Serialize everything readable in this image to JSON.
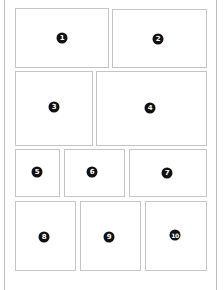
{
  "diagram": {
    "title": "",
    "colors": {
      "panel_border": "#c4c4c4",
      "frame_border": "#bdbdbd",
      "badge_fill": "#111111",
      "badge_text": "#ffffff",
      "background": "#ffffff"
    },
    "panels": [
      {
        "number": "1",
        "x": 15,
        "y": 8,
        "w": 94,
        "h": 60,
        "badge_x": 62,
        "badge_y": 38
      },
      {
        "number": "2",
        "x": 112,
        "y": 9,
        "w": 95,
        "h": 59,
        "badge_x": 158,
        "badge_y": 39
      },
      {
        "number": "3",
        "x": 15,
        "y": 71,
        "w": 78,
        "h": 75,
        "badge_x": 54,
        "badge_y": 107
      },
      {
        "number": "4",
        "x": 96,
        "y": 71,
        "w": 111,
        "h": 75,
        "badge_x": 150,
        "badge_y": 108
      },
      {
        "number": "5",
        "x": 15,
        "y": 149,
        "w": 45,
        "h": 48,
        "badge_x": 37,
        "badge_y": 172
      },
      {
        "number": "6",
        "x": 64,
        "y": 149,
        "w": 61,
        "h": 48,
        "badge_x": 92,
        "badge_y": 172
      },
      {
        "number": "7",
        "x": 129,
        "y": 149,
        "w": 78,
        "h": 48,
        "badge_x": 167,
        "badge_y": 173
      },
      {
        "number": "8",
        "x": 15,
        "y": 201,
        "w": 61,
        "h": 70,
        "badge_x": 44,
        "badge_y": 237
      },
      {
        "number": "9",
        "x": 80,
        "y": 201,
        "w": 61,
        "h": 70,
        "badge_x": 109,
        "badge_y": 237
      },
      {
        "number": "10",
        "x": 145,
        "y": 201,
        "w": 62,
        "h": 70,
        "badge_x": 175,
        "badge_y": 235
      }
    ]
  }
}
